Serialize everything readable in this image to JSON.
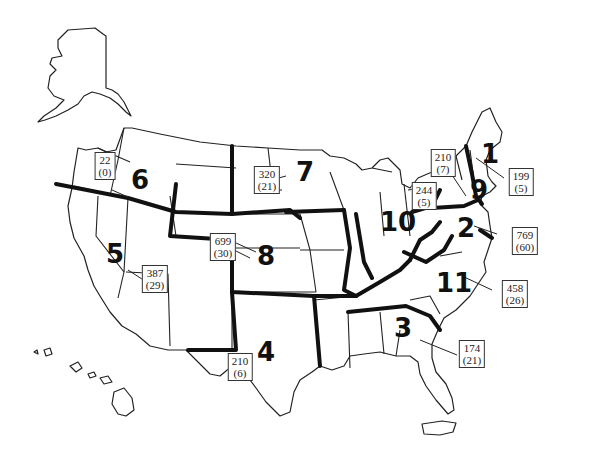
{
  "map": {
    "title": "",
    "regions": [
      {
        "number": "1",
        "count": "199",
        "sub": "(5)"
      },
      {
        "number": "2",
        "count": "769",
        "sub": "(60)"
      },
      {
        "number": "3",
        "count": "174",
        "sub": "(21)"
      },
      {
        "number": "4",
        "count": "210",
        "sub": "(6)"
      },
      {
        "number": "5",
        "count": "387",
        "sub": "(29)"
      },
      {
        "number": "6",
        "count": "22",
        "sub": "(0)"
      },
      {
        "number": "7",
        "count": "320",
        "sub": "(21)"
      },
      {
        "number": "8",
        "count": "699",
        "sub": "(30)"
      },
      {
        "number": "9",
        "count": "210",
        "sub": "(7)"
      },
      {
        "number": "10",
        "count": "244",
        "sub": "(5)"
      },
      {
        "number": "11",
        "count": "458",
        "sub": "(26)"
      }
    ],
    "colors": {
      "line": "#111111",
      "background": "#ffffff"
    }
  }
}
